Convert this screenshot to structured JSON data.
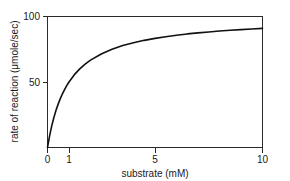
{
  "chart_data": {
    "type": "line",
    "title": "",
    "xlabel": "substrate (mM)",
    "ylabel": "rate of reaction (μmole/sec)",
    "xlim": [
      0,
      10
    ],
    "ylim": [
      0,
      100
    ],
    "xticks": [
      0,
      1,
      5,
      10
    ],
    "xticklabels": [
      "0",
      "1",
      "5",
      "10"
    ],
    "yticks": [
      50,
      100
    ],
    "yticklabels": [
      "50",
      "100"
    ],
    "grid": false,
    "legend": false,
    "curve_color": "#111111",
    "axis_color": "#2b2b2b",
    "background": "#ffffff",
    "model": "Michaelis-Menten",
    "vmax": 100,
    "km": 1,
    "series": [
      {
        "name": "rate of reaction",
        "x": [
          0,
          0.1,
          0.2,
          0.3,
          0.4,
          0.5,
          0.6,
          0.7,
          0.8,
          0.9,
          1.0,
          1.25,
          1.5,
          1.75,
          2.0,
          2.5,
          3.0,
          3.5,
          4.0,
          4.5,
          5.0,
          5.5,
          6.0,
          6.5,
          7.0,
          7.5,
          8.0,
          8.5,
          9.0,
          9.5,
          10.0
        ],
        "values": [
          0,
          9.1,
          16.7,
          23.1,
          28.6,
          33.3,
          37.5,
          41.2,
          44.4,
          47.4,
          50.0,
          55.6,
          60.0,
          63.6,
          66.7,
          71.4,
          75.0,
          77.8,
          80.0,
          81.8,
          83.3,
          84.6,
          85.7,
          86.7,
          87.5,
          88.2,
          88.9,
          89.5,
          90.0,
          90.5,
          90.9
        ]
      }
    ]
  },
  "axis_labels": {
    "x_title": "substrate (mM)",
    "y_title": "rate of reaction (μmole/sec)",
    "x_tick_0": "0",
    "x_tick_1": "1",
    "x_tick_5": "5",
    "x_tick_10": "10",
    "y_tick_50": "50",
    "y_tick_100": "100"
  }
}
